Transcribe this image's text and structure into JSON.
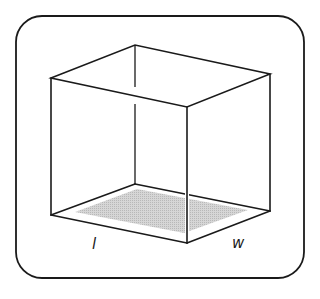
{
  "diagram": {
    "frame": {
      "x": 16,
      "y": 16,
      "width": 288,
      "height": 262,
      "radius": 26
    },
    "vertices": {
      "top_left": [
        51,
        78
      ],
      "top_back": [
        135,
        45
      ],
      "top_right": [
        270,
        74
      ],
      "top_front": [
        187,
        107
      ],
      "bottom_left": [
        51,
        215
      ],
      "bottom_back": [
        135,
        184
      ],
      "bottom_right": [
        270,
        211
      ],
      "bottom_front": [
        187,
        243
      ]
    },
    "shaded_base": {
      "points": [
        [
          75,
          212
        ],
        [
          137,
          189
        ],
        [
          248,
          210
        ],
        [
          184,
          233
        ]
      ],
      "color": "#c8c8c8",
      "description": "base area (l × w)"
    },
    "labels": {
      "length": "l",
      "width": "w"
    },
    "colors": {
      "stroke": "#1a1a1a",
      "shade": "#c8c8c8",
      "background": "#ffffff"
    }
  }
}
